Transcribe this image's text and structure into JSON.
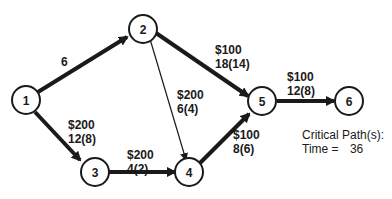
{
  "diagram": {
    "type": "project-network",
    "nodes": [
      {
        "id": "1",
        "label": "1"
      },
      {
        "id": "2",
        "label": "2"
      },
      {
        "id": "3",
        "label": "3"
      },
      {
        "id": "4",
        "label": "4"
      },
      {
        "id": "5",
        "label": "5"
      },
      {
        "id": "6",
        "label": "6"
      }
    ],
    "edges": [
      {
        "from": "1",
        "to": "2",
        "cost": "",
        "time": "6",
        "bold": true
      },
      {
        "from": "1",
        "to": "3",
        "cost": "$200",
        "time": "12(8)",
        "bold": true
      },
      {
        "from": "2",
        "to": "4",
        "cost": "$200",
        "time": "6(4)",
        "bold": false
      },
      {
        "from": "2",
        "to": "5",
        "cost": "$100",
        "time": "18(14)",
        "bold": true
      },
      {
        "from": "3",
        "to": "4",
        "cost": "$200",
        "time": "4(2)",
        "bold": true
      },
      {
        "from": "4",
        "to": "5",
        "cost": "$100",
        "time": "8(6)",
        "bold": true
      },
      {
        "from": "5",
        "to": "6",
        "cost": "$100",
        "time": "12(8)",
        "bold": true
      }
    ],
    "critical_path_label": "Critical Path(s):",
    "time_label": "Time =",
    "time_value": "36"
  }
}
